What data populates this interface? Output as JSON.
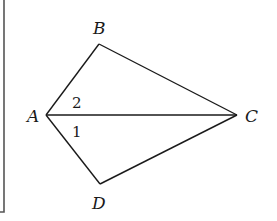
{
  "diagram": {
    "type": "geometry-figure",
    "points": {
      "A": {
        "label": "A",
        "x": 46,
        "y": 115
      },
      "B": {
        "label": "B",
        "x": 99,
        "y": 44
      },
      "C": {
        "label": "C",
        "x": 237,
        "y": 115
      },
      "D": {
        "label": "D",
        "x": 100,
        "y": 184
      }
    },
    "segments": [
      "AB",
      "BC",
      "CD",
      "DA",
      "AC"
    ],
    "angle_labels": [
      {
        "label": "2",
        "at": "A",
        "between": [
          "AB",
          "AC"
        ]
      },
      {
        "label": "1",
        "at": "A",
        "between": [
          "AC",
          "AD"
        ]
      }
    ],
    "colors": {
      "stroke": "#1a1a1a",
      "frame": "#555555",
      "background": "#ffffff"
    }
  }
}
